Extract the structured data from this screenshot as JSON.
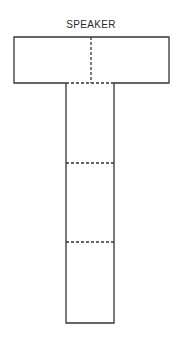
{
  "diagram": {
    "title": "SPEAKER",
    "shape": "T-shaped table layout",
    "top_bar": {
      "x": 14,
      "y": 37,
      "width": 155,
      "height": 46,
      "divider": "dashed vertical at center"
    },
    "stem": {
      "x": 66,
      "y": 83,
      "width": 48,
      "height": 240,
      "dividers_y": [
        163,
        242
      ]
    },
    "colors": {
      "line": "#333333",
      "background": "#ffffff"
    }
  }
}
